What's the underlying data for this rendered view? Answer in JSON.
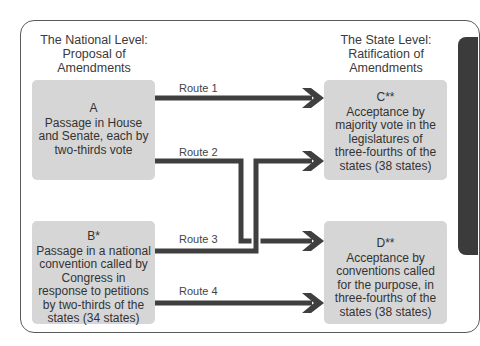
{
  "diagram": {
    "colors": {
      "box_fill": "#d6d6d6",
      "line": "#3f3f3f",
      "frame_border": "#5a5a5a",
      "side_tab": "#3b3b3b",
      "text": "#333333"
    },
    "left_heading": {
      "lines": [
        "The National Level:",
        "Proposal of",
        "Amendments"
      ]
    },
    "right_heading": {
      "lines": [
        "The State Level:",
        "Ratification of",
        "Amendments"
      ]
    },
    "nodes": {
      "A": {
        "letter": "A",
        "lines": [
          "Passage in House",
          "and Senate, each by",
          "two-thirds vote"
        ]
      },
      "B": {
        "letter": "B*",
        "lines": [
          "Passage in a national",
          "convention called by",
          "Congress in",
          "response to petitions",
          "by two-thirds of the",
          "states (34 states)"
        ]
      },
      "C": {
        "letter": "C**",
        "lines": [
          "Acceptance by",
          "majority vote in the",
          "legislatures of",
          "three-fourths of the",
          "states (38 states)"
        ]
      },
      "D": {
        "letter": "D**",
        "lines": [
          "Acceptance by",
          "conventions called",
          "for the purpose, in",
          "three-fourths of the",
          "states (38 states)"
        ]
      }
    },
    "routes": [
      {
        "label": "Route 1",
        "from": "A",
        "to": "C"
      },
      {
        "label": "Route 2",
        "from": "A",
        "to": "D"
      },
      {
        "label": "Route 3",
        "from": "B",
        "to": "C"
      },
      {
        "label": "Route 4",
        "from": "B",
        "to": "D"
      }
    ]
  }
}
